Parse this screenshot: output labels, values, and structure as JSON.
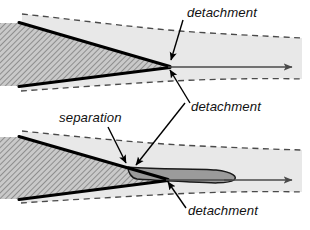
{
  "figure": {
    "width": 310,
    "height": 230,
    "background": "#ffffff"
  },
  "colors": {
    "background": "#ffffff",
    "shear_band": "#e8e8e8",
    "wedge_hatch_base": "#c9c9c9",
    "wedge_hatch_line": "#8d8d8d",
    "bubble_fill": "#9b9b9b",
    "outline": "#000000",
    "dashed_line": "#4a4a4a",
    "axis_arrow": "#4a4a4a",
    "leader_arrow": "#000000",
    "text": "#111111"
  },
  "panels": [
    {
      "id": "top-panel",
      "name": "attached-flow-panel",
      "labels": [
        {
          "id": "top-detachment-upper",
          "name": "label-detachment-upper",
          "text": "detachment",
          "x": 187,
          "y": 17,
          "anchor": "start"
        },
        {
          "id": "top-detachment-lower",
          "name": "label-detachment-lower",
          "text": "detachment",
          "x": 191,
          "y": 111,
          "anchor": "start"
        }
      ],
      "leaders": [
        {
          "id": "top-leader-upper",
          "name": "leader-arrow-detachment-upper",
          "from": [
            183,
            20
          ],
          "to": [
            170,
            63
          ]
        },
        {
          "id": "top-leader-lower",
          "name": "leader-arrow-detachment-lower",
          "from": [
            190,
            103
          ],
          "to": [
            169,
            67
          ]
        }
      ],
      "axis_arrow": {
        "name": "flow-axis-arrow",
        "from": [
          168,
          67
        ],
        "to": [
          296,
          67
        ]
      }
    },
    {
      "id": "bottom-panel",
      "name": "separated-flow-panel",
      "labels": [
        {
          "id": "bottom-separation",
          "name": "label-separation",
          "text": "separation",
          "x": 59,
          "y": 122,
          "anchor": "start"
        },
        {
          "id": "bottom-detachment-upper",
          "name": "label-detachment-upper",
          "text": "detachment",
          "x": 191,
          "y": 111,
          "anchor": "start"
        },
        {
          "id": "bottom-detachment-lower",
          "name": "label-detachment-lower",
          "text": "detachment",
          "x": 188,
          "y": 215,
          "anchor": "start"
        }
      ],
      "leaders": [
        {
          "id": "bottom-leader-separation",
          "name": "leader-arrow-separation",
          "from": [
            108,
            128
          ],
          "to": [
            128,
            166
          ]
        },
        {
          "id": "bottom-leader-detachment-upper",
          "name": "leader-arrow-detachment-upper",
          "from": [
            185,
            103
          ],
          "to": [
            133,
            168
          ]
        },
        {
          "id": "bottom-leader-detachment-lower",
          "name": "leader-arrow-detachment-lower",
          "from": [
            186,
            208
          ],
          "to": [
            167,
            179
          ]
        }
      ],
      "axis_arrow": {
        "name": "flow-axis-arrow",
        "from": [
          166,
          180
        ],
        "to": [
          296,
          180
        ]
      },
      "bubble": {
        "name": "separation-bubble",
        "description": "dark grey recirculation lens aft of the cone tip"
      }
    }
  ]
}
